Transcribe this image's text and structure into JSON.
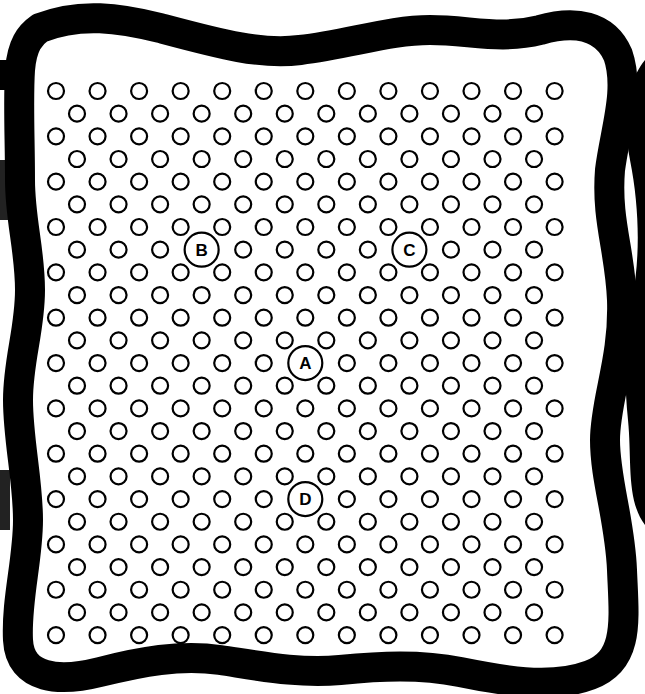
{
  "figure": {
    "width": 645,
    "height": 694,
    "background": "#ffffff",
    "ink": "#000000"
  },
  "grid": {
    "rows": 25,
    "first_row_y": 91,
    "row_step": 22.67,
    "wide_row_count": 13,
    "wide_row_x0": 56,
    "narrow_row_count": 12,
    "narrow_row_x0": 77,
    "col_step": 41.55,
    "dot_radius": 8,
    "dot_stroke": 2.2
  },
  "labeled_points": [
    {
      "label": "A",
      "row": 12,
      "col": 6,
      "radius": 17
    },
    {
      "label": "B",
      "row": 7,
      "col": 3,
      "radius": 17
    },
    {
      "label": "C",
      "row": 7,
      "col": 8,
      "radius": 17
    },
    {
      "label": "D",
      "row": 18,
      "col": 6,
      "radius": 17
    }
  ],
  "border": {
    "style": "wavy-thick",
    "stroke_width": 30
  }
}
